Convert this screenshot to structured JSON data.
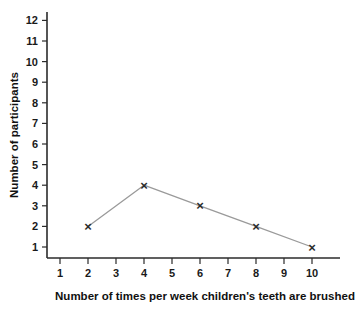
{
  "chart_data": {
    "type": "line",
    "title": "",
    "xlabel": "Number of times per week children's teeth are brushed",
    "ylabel": "Number of participants",
    "x": [
      2,
      4,
      6,
      8,
      10
    ],
    "values": [
      2,
      4,
      3,
      2,
      1
    ],
    "series": [
      {
        "name": "Number of participants",
        "x": [
          2,
          4,
          6,
          8,
          10
        ],
        "values": [
          2,
          4,
          3,
          2,
          1
        ]
      }
    ],
    "xlim": [
      1,
      10
    ],
    "ylim": [
      1,
      12
    ],
    "x_tick_labels": [
      "1",
      "2",
      "3",
      "4",
      "5",
      "6",
      "7",
      "8",
      "9",
      "10"
    ],
    "y_tick_labels": [
      "1",
      "2",
      "3",
      "4",
      "5",
      "6",
      "7",
      "8",
      "9",
      "10",
      "11",
      "12"
    ],
    "grid": false,
    "legend": false,
    "legend_position": "none",
    "marker": "x",
    "marker_color": "#2b2b2b",
    "line_color": "#9a9a9a",
    "background_color": "#ffffff",
    "axis_color": "#2b2b2b"
  }
}
